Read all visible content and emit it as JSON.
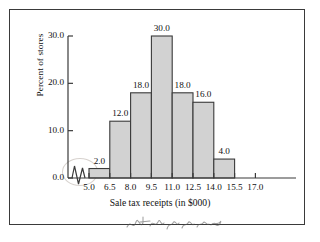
{
  "chart_data": {
    "type": "bar",
    "title": "",
    "xlabel": "Sale tax receipts (in $000)",
    "ylabel": "Percent of stores",
    "categories": [
      "5.0-6.5",
      "6.5-8.0",
      "8.0-9.5",
      "9.5-11.0",
      "11.0-12.5",
      "12.5-14.0",
      "14.0-15.5"
    ],
    "bin_edges": [
      5.0,
      6.5,
      8.0,
      9.5,
      11.0,
      12.5,
      14.0,
      15.5
    ],
    "values": [
      2.0,
      12.0,
      18.0,
      30.0,
      18.0,
      16.0,
      4.0
    ],
    "bar_labels": [
      "2.0",
      "12.0",
      "18.0",
      "30.0",
      "18.0",
      "16.0",
      "4.0"
    ],
    "xticks": [
      "5.0",
      "6.5",
      "8.0",
      "9.5",
      "11.0",
      "12.5",
      "14.0",
      "15.5",
      "17.0"
    ],
    "xtick_values": [
      5.0,
      6.5,
      8.0,
      9.5,
      11.0,
      12.5,
      14.0,
      15.5,
      17.0
    ],
    "yticks": [
      "0.0",
      "10.0",
      "20.0",
      "30.0"
    ],
    "ytick_values": [
      0.0,
      10.0,
      20.0,
      30.0
    ],
    "ylim": [
      0.0,
      30.0
    ],
    "xlim": [
      5.0,
      17.0
    ],
    "grid": false,
    "legend": null,
    "axis_break": true,
    "bar_fill_color": "#d2d2d2",
    "bar_edge_color": "#3a3a3a",
    "axis_color": "#3a3a3a",
    "text_color": "#111111"
  },
  "annotations": {
    "handwriting": "handwritten scribble",
    "circle_mark": "pencil circle around axis break"
  }
}
